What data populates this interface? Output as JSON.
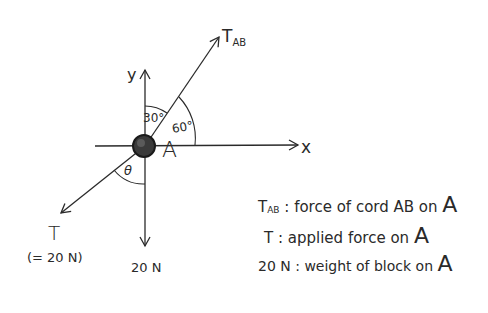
{
  "diagram": {
    "type": "free-body diagram",
    "point": {
      "label": "A"
    },
    "axes": {
      "x_label": "x",
      "y_label": "y"
    },
    "forces": [
      {
        "id": "tab",
        "label": "T",
        "subscript": "AB",
        "direction": "up-right"
      },
      {
        "id": "t",
        "label": "T",
        "note": "(= 20 N)",
        "direction": "down-left"
      },
      {
        "id": "weight",
        "label": "20 N",
        "direction": "down"
      }
    ],
    "angles": [
      {
        "label": "30°",
        "between": "y-axis and T_AB"
      },
      {
        "label": "60°",
        "between": "x-axis and T_AB"
      },
      {
        "label": "θ",
        "between": "T and downward vertical"
      }
    ]
  },
  "legend": [
    {
      "symbol": "T",
      "subscript": "AB",
      "text": "force of cord AB on",
      "target": "A"
    },
    {
      "symbol": "T",
      "subscript": "",
      "text": "applied force  on",
      "target": "A"
    },
    {
      "symbol": "20 N",
      "subscript": "",
      "text": "weight of block on",
      "target": "A"
    }
  ]
}
